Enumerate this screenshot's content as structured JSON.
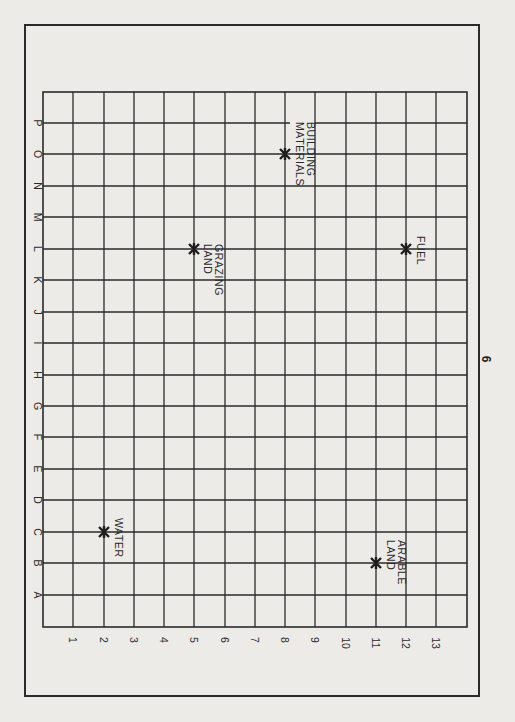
{
  "page": {
    "number": "6"
  },
  "grid": {
    "columns": [
      "1",
      "2",
      "3",
      "4",
      "5",
      "6",
      "7",
      "8",
      "9",
      "10",
      "11",
      "12",
      "13"
    ],
    "rows": [
      "P",
      "O",
      "N",
      "M",
      "L",
      "K",
      "J",
      "I",
      "H",
      "G",
      "F",
      "E",
      "D",
      "C",
      "B",
      "A"
    ]
  },
  "resources": [
    {
      "name": "water",
      "label_line1": "WATER",
      "label_line2": "",
      "col": "2",
      "row": "C"
    },
    {
      "name": "grazing-land",
      "label_line1": "GRAZING",
      "label_line2": "LAND",
      "col": "5",
      "row": "L"
    },
    {
      "name": "building-materials",
      "label_line1": "BUILDING",
      "label_line2": "MATERIALS",
      "col": "8",
      "row": "O"
    },
    {
      "name": "fuel",
      "label_line1": "FUEL",
      "label_line2": "",
      "col": "12",
      "row": "L"
    },
    {
      "name": "arable-land",
      "label_line1": "ARABLE",
      "label_line2": "LAND",
      "col": "11",
      "row": "B"
    }
  ],
  "colors": {
    "ink": "#2a2a2a",
    "paper": "#ecebe8"
  }
}
